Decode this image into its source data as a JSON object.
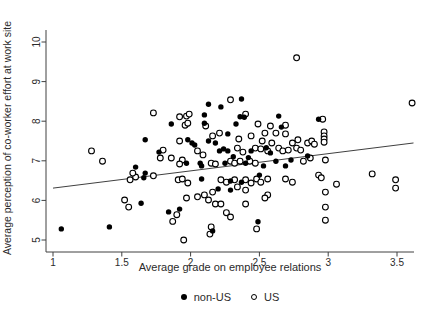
{
  "figure": {
    "background_color": "#ffffff",
    "text_color": "#2b2b2b",
    "axis_color": "#404040",
    "marker_color": "#000000"
  },
  "chart_data": {
    "type": "scatter",
    "title": "",
    "xlabel": "Average grade on employee relations",
    "ylabel": "Average perception of co-worker effort at work site",
    "xlim": [
      0.95,
      3.65
    ],
    "ylim": [
      4.7,
      10.3
    ],
    "x_ticks": [
      1,
      1.5,
      2,
      2.5,
      3,
      3.5
    ],
    "y_ticks": [
      5,
      6,
      7,
      8,
      9,
      10
    ],
    "grid": false,
    "legend_position": "bottom-center",
    "trend_line": {
      "x1": 1.0,
      "y1": 6.31,
      "x2": 3.62,
      "y2": 7.45
    },
    "series": [
      {
        "name": "non-US",
        "marker": "filled-circle",
        "color": "#000000",
        "points": [
          [
            2.13,
            8.43
          ],
          [
            2.22,
            8.36
          ],
          [
            2.37,
            8.56
          ],
          [
            2.1,
            8.16
          ],
          [
            2.36,
            8.11
          ],
          [
            2.39,
            8.1
          ],
          [
            1.86,
            7.93
          ],
          [
            2.1,
            7.95
          ],
          [
            2.33,
            7.93
          ],
          [
            2.64,
            8.13
          ],
          [
            2.66,
            7.85
          ],
          [
            2.93,
            8.05
          ],
          [
            1.67,
            7.53
          ],
          [
            1.77,
            7.22
          ],
          [
            1.98,
            7.53
          ],
          [
            2.01,
            7.45
          ],
          [
            2.03,
            7.4
          ],
          [
            2.13,
            7.5
          ],
          [
            2.18,
            7.45
          ],
          [
            2.21,
            7.25
          ],
          [
            2.24,
            7.3
          ],
          [
            2.27,
            7.25
          ],
          [
            2.27,
            7.68
          ],
          [
            2.44,
            7.25
          ],
          [
            2.58,
            7.2
          ],
          [
            2.31,
            7.1
          ],
          [
            2.42,
            7.08
          ],
          [
            2.55,
            7.33
          ],
          [
            1.6,
            6.84
          ],
          [
            1.67,
            6.69
          ],
          [
            1.97,
            6.94
          ],
          [
            2.07,
            6.94
          ],
          [
            2.08,
            6.87
          ],
          [
            2.25,
            6.94
          ],
          [
            2.4,
            6.94
          ],
          [
            2.53,
            6.87
          ],
          [
            2.62,
            6.99
          ],
          [
            2.69,
            6.87
          ],
          [
            2.73,
            7.02
          ],
          [
            2.85,
            7.12
          ],
          [
            2.5,
            6.64
          ],
          [
            1.66,
            6.57
          ],
          [
            2.08,
            6.54
          ],
          [
            2.29,
            6.49
          ],
          [
            2.37,
            6.46
          ],
          [
            2.2,
            6.29
          ],
          [
            2.29,
            6.26
          ],
          [
            1.64,
            5.93
          ],
          [
            1.84,
            5.71
          ],
          [
            1.92,
            5.78
          ],
          [
            2.49,
            5.46
          ],
          [
            2.16,
            5.23
          ],
          [
            1.06,
            5.28
          ],
          [
            1.41,
            5.33
          ]
        ]
      },
      {
        "name": "US",
        "marker": "open-circle",
        "color": "#000000",
        "points": [
          [
            2.77,
            9.6
          ],
          [
            2.29,
            8.54
          ],
          [
            3.61,
            8.46
          ],
          [
            1.73,
            8.21
          ],
          [
            2.4,
            8.18
          ],
          [
            1.92,
            8.11
          ],
          [
            1.97,
            8.13
          ],
          [
            1.99,
            8.18
          ],
          [
            1.96,
            7.9
          ],
          [
            1.98,
            7.95
          ],
          [
            2.11,
            7.88
          ],
          [
            2.49,
            7.93
          ],
          [
            2.58,
            7.88
          ],
          [
            2.69,
            7.9
          ],
          [
            2.54,
            7.7
          ],
          [
            2.62,
            7.7
          ],
          [
            2.69,
            7.68
          ],
          [
            2.96,
            8.05
          ],
          [
            2.16,
            7.63
          ],
          [
            2.21,
            7.7
          ],
          [
            2.44,
            7.63
          ],
          [
            2.35,
            7.55
          ],
          [
            1.28,
            7.25
          ],
          [
            1.36,
            6.99
          ],
          [
            1.8,
            7.27
          ],
          [
            1.78,
            7.07
          ],
          [
            1.92,
            7.5
          ],
          [
            2.05,
            7.25
          ],
          [
            2.09,
            7.15
          ],
          [
            2.34,
            7.32
          ],
          [
            2.38,
            7.22
          ],
          [
            2.47,
            7.32
          ],
          [
            2.51,
            7.3
          ],
          [
            2.56,
            7.25
          ],
          [
            2.64,
            7.32
          ],
          [
            2.67,
            7.25
          ],
          [
            2.71,
            7.27
          ],
          [
            2.52,
            7.5
          ],
          [
            2.59,
            7.45
          ],
          [
            2.97,
            7.73
          ],
          [
            2.97,
            7.63
          ],
          [
            2.97,
            7.55
          ],
          [
            2.97,
            7.47
          ],
          [
            2.74,
            7.45
          ],
          [
            2.78,
            7.53
          ],
          [
            2.85,
            7.45
          ],
          [
            2.88,
            7.5
          ],
          [
            2.9,
            7.42
          ],
          [
            2.77,
            7.32
          ],
          [
            2.8,
            7.27
          ],
          [
            2.87,
            7.07
          ],
          [
            2.82,
            6.99
          ],
          [
            2.98,
            7.02
          ],
          [
            2.93,
            6.64
          ],
          [
            3.32,
            6.67
          ],
          [
            1.86,
            7.07
          ],
          [
            1.94,
            7.02
          ],
          [
            1.92,
            6.92
          ],
          [
            2.15,
            6.94
          ],
          [
            2.18,
            6.92
          ],
          [
            2.29,
            6.99
          ],
          [
            2.32,
            6.94
          ],
          [
            2.36,
            6.99
          ],
          [
            2.43,
            6.99
          ],
          [
            2.47,
            6.94
          ],
          [
            1.56,
            6.52
          ],
          [
            1.6,
            6.59
          ],
          [
            1.58,
            6.69
          ],
          [
            1.73,
            6.62
          ],
          [
            1.52,
            6.01
          ],
          [
            1.55,
            5.83
          ],
          [
            1.91,
            6.52
          ],
          [
            1.94,
            6.54
          ],
          [
            1.98,
            6.44
          ],
          [
            2.22,
            6.52
          ],
          [
            2.26,
            6.46
          ],
          [
            2.32,
            6.52
          ],
          [
            2.4,
            6.52
          ],
          [
            2.44,
            6.44
          ],
          [
            2.48,
            6.54
          ],
          [
            2.51,
            6.46
          ],
          [
            2.56,
            6.54
          ],
          [
            2.69,
            6.54
          ],
          [
            2.34,
            6.34
          ],
          [
            2.4,
            6.26
          ],
          [
            2.16,
            6.21
          ],
          [
            2.1,
            6.14
          ],
          [
            2.05,
            6.09
          ],
          [
            1.97,
            6.06
          ],
          [
            2.13,
            6.01
          ],
          [
            2.18,
            5.91
          ],
          [
            2.22,
            5.91
          ],
          [
            2.56,
            6.14
          ],
          [
            2.54,
            6.06
          ],
          [
            2.4,
            5.91
          ],
          [
            2.26,
            5.69
          ],
          [
            2.29,
            5.58
          ],
          [
            1.9,
            5.64
          ],
          [
            1.87,
            5.47
          ],
          [
            2.48,
            5.28
          ],
          [
            1.95,
            5.0
          ],
          [
            2.15,
            5.33
          ],
          [
            2.14,
            5.15
          ],
          [
            2.74,
            6.46
          ],
          [
            2.95,
            6.57
          ],
          [
            3.06,
            6.41
          ],
          [
            2.98,
            6.21
          ],
          [
            2.98,
            5.83
          ],
          [
            2.98,
            5.5
          ],
          [
            3.49,
            6.52
          ],
          [
            3.49,
            6.31
          ]
        ]
      }
    ]
  },
  "legend": {
    "items": [
      {
        "label": "non-US",
        "marker": "filled-circle"
      },
      {
        "label": "US",
        "marker": "open-circle"
      }
    ]
  }
}
